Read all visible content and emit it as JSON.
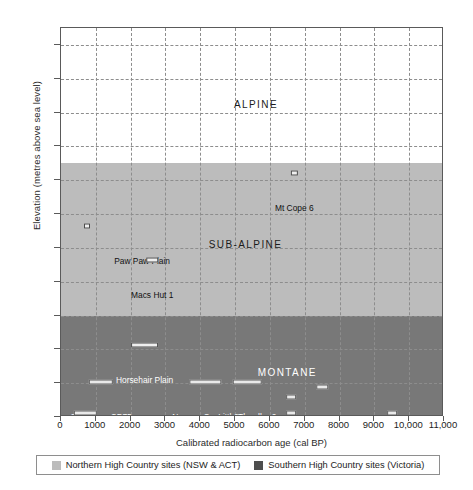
{
  "chart_data": {
    "type": "scatter",
    "title": "",
    "xlabel": "Calibrated radiocarbon age (cal BP)",
    "ylabel": "Elevation (metres above sea level)",
    "xlim": [
      0,
      11000
    ],
    "ylim": [
      1100,
      2250
    ],
    "grid": true,
    "x_ticks": [
      "0",
      "1000",
      "2000",
      "3000",
      "4000",
      "5000",
      "6000",
      "7000",
      "8000",
      "9000",
      "10,000",
      "11,000"
    ],
    "x_tick_values": [
      0,
      1000,
      2000,
      3000,
      4000,
      5000,
      6000,
      7000,
      8000,
      9000,
      10000,
      11000
    ],
    "y_ticks": [
      "1100",
      "1200",
      "1300",
      "1400",
      "1500",
      "1600",
      "1700",
      "1800",
      "1900",
      "2000",
      "2100",
      "2200"
    ],
    "y_tick_values": [
      1100,
      1200,
      1300,
      1400,
      1500,
      1600,
      1700,
      1800,
      1900,
      2000,
      2100,
      2200
    ],
    "bands": [
      {
        "name": "ALPINE",
        "label": "ALPINE",
        "from": 1850,
        "to": 2250,
        "color": "#ffffff",
        "label_x": 5600,
        "label_y": 2040,
        "label_on_dark": false
      },
      {
        "name": "SUB-ALPINE",
        "label": "SUB-ALPINE",
        "from": 1400,
        "to": 1850,
        "color": "#bcbcbc",
        "label_x": 5300,
        "label_y": 1625,
        "label_on_dark": false
      },
      {
        "name": "MONTANE",
        "label": "MONTANE",
        "from": 1100,
        "to": 1400,
        "color": "#787878",
        "label_x": 6500,
        "label_y": 1248,
        "label_on_dark": true
      }
    ],
    "series": [
      {
        "name": "Northern High Country sites (NSW & ACT)",
        "color": "#bcbcbc"
      },
      {
        "name": "Southern High Country sites (Victoria)",
        "color": "#4e4e4e"
      }
    ],
    "points": [
      {
        "label": "Mt Cope 6",
        "group": "south",
        "x": 6700,
        "y": 1822,
        "x_span": 180,
        "label_dx": 0,
        "label_dy": -30,
        "label_on_dark": false
      },
      {
        "label": "Paw Paw Plain",
        "group": "south",
        "x": 750,
        "y": 1665,
        "x_span": 120,
        "label_dx": 55,
        "label_dy": -30,
        "label_on_dark": false
      },
      {
        "label": "Macs Hut 1",
        "group": "south",
        "x": 2620,
        "y": 1565,
        "x_span": 330,
        "label_dx": 0,
        "label_dy": -30,
        "label_on_dark": false
      },
      {
        "label": "Horsehair Plain",
        "group": "south",
        "x": 2400,
        "y": 1312,
        "x_span": 800,
        "label_dx": 0,
        "label_dy": -30,
        "label_on_dark": true
      },
      {
        "label": "Cooleman CP75",
        "group": "north",
        "x": 1150,
        "y": 1202,
        "x_span": 700,
        "label_dx": 0,
        "label_dy": -30,
        "label_on_dark": true
      },
      {
        "label": "Nursery Swamp 2",
        "group": "north",
        "x": 4150,
        "y": 1202,
        "x_span": 900,
        "label_dx": 0,
        "label_dy": -30,
        "label_on_dark": true
      },
      {
        "label": "Little Thredbo 2",
        "group": "north",
        "x": 5350,
        "y": 1202,
        "x_span": 820,
        "label_dx": 0,
        "label_dy": -30,
        "label_on_dark": true
      },
      {
        "label": "Bulls Flat",
        "group": "north",
        "x": 7500,
        "y": 1188,
        "x_span": 330,
        "label_dx": 0,
        "label_dy": -30,
        "label_on_dark": true
      },
      {
        "label": "Yankee Hat 2",
        "group": "north",
        "x": 700,
        "y": 1112,
        "x_span": 640,
        "label_dx": 115,
        "label_dy": -18,
        "label_on_dark": true
      },
      {
        "label": "Boboyan",
        "group": "north",
        "x": 6600,
        "y": 1160,
        "x_span": 280,
        "label_dx": 0,
        "label_dy": -30,
        "label_on_dark": true
      },
      {
        "label": "Nursery Swamp South",
        "group": "north",
        "x": 6600,
        "y": 1112,
        "x_span": 280,
        "label_dx": -300,
        "label_dy": -18,
        "label_on_dark": true
      },
      {
        "label": "Yarrangobilly 259",
        "group": "north",
        "x": 9500,
        "y": 1112,
        "x_span": 280,
        "label_dx": -330,
        "label_dy": -18,
        "label_on_dark": true
      }
    ]
  },
  "legend": {
    "items": [
      {
        "label": "Northern High Country sites (NSW & ACT)",
        "swatch": "north"
      },
      {
        "label": "Southern High Country sites (Victoria)",
        "swatch": "south"
      }
    ]
  }
}
